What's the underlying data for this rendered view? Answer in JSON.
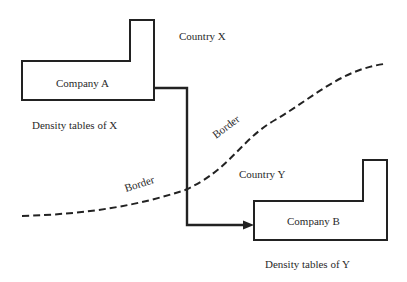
{
  "diagram": {
    "country_x": {
      "label": "Country X"
    },
    "country_y": {
      "label": "Country Y"
    },
    "company_a": {
      "label": "Company A",
      "caption": "Density tables of X"
    },
    "company_b": {
      "label": "Company B",
      "caption": "Density tables of Y"
    },
    "border": {
      "label_upper": "Border",
      "label_lower": "Border"
    },
    "colors": {
      "stroke": "#222222",
      "text": "#2a2a2a",
      "background": "#ffffff"
    }
  }
}
